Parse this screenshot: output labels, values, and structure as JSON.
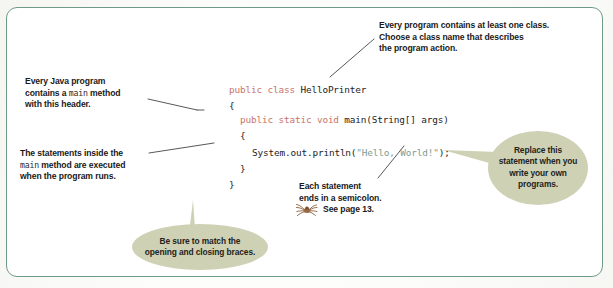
{
  "figure": {
    "frame_color": "#6f9b86",
    "background_color": "#ffffff",
    "keyword_color": "#c9736a",
    "string_color": "#7e9c93",
    "bubble_color": "#cfd1b5",
    "leader_color": "#3a3a3a",
    "spider_color": "#9a6a44"
  },
  "code": {
    "lines": [
      {
        "id": "line-class-decl",
        "indent": 0,
        "tokens": [
          {
            "kind": "kw",
            "text": "public class "
          },
          {
            "kind": "plain",
            "text": "HelloPrinter"
          }
        ]
      },
      {
        "id": "line-open-brace-class",
        "indent": 0,
        "tokens": [
          {
            "kind": "plain",
            "text": "{"
          }
        ]
      },
      {
        "id": "line-main-decl",
        "indent": 1,
        "tokens": [
          {
            "kind": "kw",
            "text": "public static void "
          },
          {
            "kind": "plain",
            "text": "main(String[] args)"
          }
        ]
      },
      {
        "id": "line-open-brace-main",
        "indent": 1,
        "tokens": [
          {
            "kind": "plain",
            "text": "{"
          }
        ]
      },
      {
        "id": "line-println",
        "indent": 2,
        "tokens": [
          {
            "kind": "plain",
            "text": "System.out.println("
          },
          {
            "kind": "str",
            "text": "\"Hello, World!\""
          },
          {
            "kind": "plain",
            "text": ");"
          }
        ]
      },
      {
        "id": "line-close-brace-main",
        "indent": 1,
        "tokens": [
          {
            "kind": "plain",
            "text": "}"
          }
        ]
      },
      {
        "id": "line-close-brace-class",
        "indent": 0,
        "tokens": [
          {
            "kind": "plain",
            "text": "}"
          }
        ]
      }
    ]
  },
  "annotations": {
    "class_note": {
      "line1": "Every program contains at least one class.",
      "line2": "Choose a class name that describes",
      "line3": "the program action."
    },
    "main_header_note": {
      "line1": "Every Java program",
      "line2_a": "contains a ",
      "line2_mono": "main",
      "line2_b": " method",
      "line3": "with this header."
    },
    "statements_note": {
      "line1": "The statements inside the",
      "line2_mono": "main",
      "line2_b": " method are executed",
      "line3": "when the program runs."
    },
    "semicolon_note": {
      "line1": "Each statement",
      "line2": "ends in a semicolon.",
      "line3": "See page 13."
    }
  },
  "bubbles": {
    "braces": {
      "line1": "Be sure to match the",
      "line2": "opening and closing braces."
    },
    "replace": {
      "line1": "Replace this",
      "line2": "statement when you",
      "line3": "write your own",
      "line4": "programs."
    }
  }
}
